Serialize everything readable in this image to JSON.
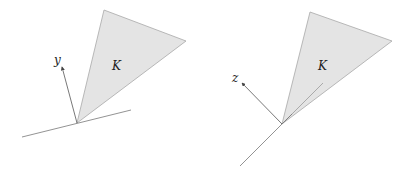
{
  "figures": [
    {
      "id": "left",
      "cone_label": "K",
      "vector_label": "y",
      "colors": {
        "cone_fill": "#e4e4e4",
        "cone_edge": "#9a9a9a",
        "line": "#777777"
      }
    },
    {
      "id": "right",
      "cone_label": "K",
      "vector_label": "z",
      "colors": {
        "cone_fill": "#e4e4e4",
        "cone_edge": "#9a9a9a",
        "line": "#777777"
      }
    }
  ]
}
